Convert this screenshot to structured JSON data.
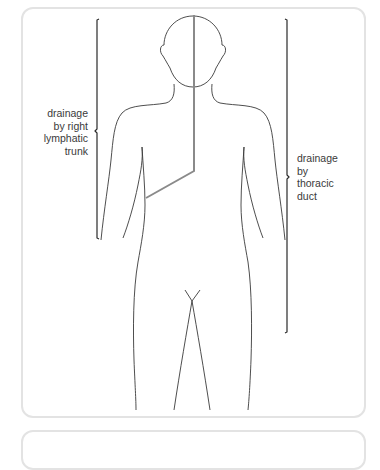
{
  "diagram": {
    "type": "anatomical lymphatic drainage diagram",
    "labels": {
      "left": [
        "drainage",
        "by right",
        "lymphatic",
        "trunk"
      ],
      "right": [
        "drainage",
        "by",
        "thoracic",
        "duct"
      ]
    },
    "colors": {
      "outline": "#3a3a3a",
      "divider_line": "#8a8a8a",
      "bracket": "#2a2a2a",
      "card_border": "#e3e3e3",
      "text": "#3a3a3a"
    }
  }
}
